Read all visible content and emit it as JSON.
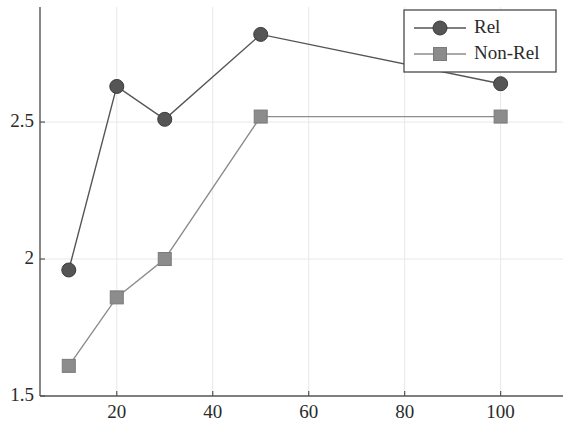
{
  "chart_data": {
    "type": "line",
    "title": "",
    "xlabel": "",
    "ylabel": "",
    "x": [
      10,
      20,
      30,
      50,
      100
    ],
    "xlim": [
      4,
      113
    ],
    "ylim": [
      1.5,
      2.92
    ],
    "grid": true,
    "legend_position": "top-right",
    "series": [
      {
        "name": "Rel",
        "marker": "circle",
        "color": "#555555",
        "values": [
          1.96,
          2.63,
          2.51,
          2.82,
          2.64
        ]
      },
      {
        "name": "Non-Rel",
        "marker": "square",
        "color": "#8c8c8c",
        "values": [
          1.61,
          1.86,
          2.0,
          2.52,
          2.52
        ]
      }
    ],
    "y_ticks": [
      {
        "value": 1.5,
        "label": "1.5"
      },
      {
        "value": 2.0,
        "label": "2"
      },
      {
        "value": 2.5,
        "label": "2.5"
      }
    ],
    "x_ticks": [
      {
        "value": 20,
        "label": "20"
      },
      {
        "value": 40,
        "label": "40"
      },
      {
        "value": 60,
        "label": "60"
      },
      {
        "value": 80,
        "label": "80"
      },
      {
        "value": 100,
        "label": "100"
      }
    ]
  },
  "legend": {
    "entries": [
      {
        "label": "Rel"
      },
      {
        "label": "Non-Rel"
      }
    ]
  },
  "colors": {
    "series_rel": "#555555",
    "series_nonrel": "#8c8c8c",
    "axis": "#555555",
    "grid": "#e8e8e8",
    "text": "#2b2b2b",
    "background": "#ffffff"
  }
}
